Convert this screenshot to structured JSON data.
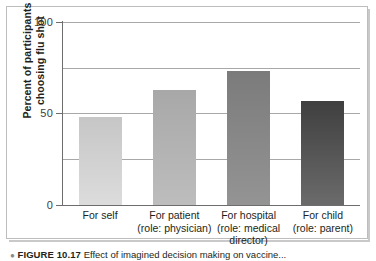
{
  "chart_data": {
    "type": "bar",
    "title": "",
    "xlabel": "",
    "ylabel": "Percent of participants choosing flu shot",
    "ylabel_lines": [
      "Percent of participants",
      "choosing flu shot"
    ],
    "categories": [
      "For self",
      "For patient (role: physician)",
      "For hospital (role: medical director)",
      "For child (role: parent)"
    ],
    "category_lines": [
      [
        "For self"
      ],
      [
        "For patient",
        "(role: physician)"
      ],
      [
        "For hospital",
        "(role: medical",
        "director)"
      ],
      [
        "For child",
        "(role: parent)"
      ]
    ],
    "values": [
      48,
      63,
      73,
      57
    ],
    "ylim": [
      0,
      100
    ],
    "yticks": [
      0,
      50,
      100
    ],
    "ytick_labels": [
      "0",
      "50",
      "100"
    ],
    "gridlines": [
      25,
      50,
      75,
      100
    ],
    "grid": true,
    "legend": "none",
    "bar_colors": [
      "#c6c6c6",
      "#a8a8a8",
      "#7b7b7b",
      "#3f3f3f"
    ],
    "bar_colors_bottom": [
      "#dcdcdc",
      "#bdbdbd",
      "#949494",
      "#6b6b6b"
    ]
  },
  "caption": {
    "marker": "●",
    "figure_number": "FIGURE 10.17",
    "text": "Effect of imagined decision making on vaccine..."
  },
  "colors": {
    "axis": "#6d6d6d",
    "grid": "#a8a8a8",
    "frame": "#bdbdbd",
    "text": "#231f20"
  }
}
